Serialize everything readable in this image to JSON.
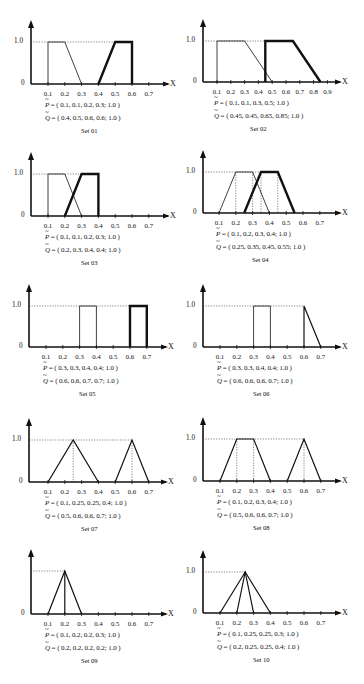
{
  "figure": {
    "y_tick_label_top": "1.0",
    "y_tick_label_zero": "0",
    "x_axis_label": "X",
    "p_symbol": "P",
    "q_symbol": "Q",
    "equals": " = ",
    "colors": {
      "ink": "#111111",
      "background": "#ffffff"
    }
  },
  "panels": [
    {
      "id": "set01",
      "label": "Set 01",
      "p_text": "( 0.1, 0.1, 0.2, 0.3; 1.0 )",
      "q_text": "( 0.4, 0.5, 0.6, 0.6; 1.0 )"
    },
    {
      "id": "set02",
      "label": "Set 02",
      "p_text": "( 0.1, 0.1, 0.3, 0.5; 1.0 )",
      "q_text": "( 0.45, 0.45, 0.65, 0.85; 1.0 )"
    },
    {
      "id": "set03",
      "label": "Set 03",
      "p_text": "( 0.1, 0.1, 0.2, 0.3; 1.0 )",
      "q_text": "( 0.2, 0.3, 0.4, 0.4; 1.0 )"
    },
    {
      "id": "set04",
      "label": "Set 04",
      "p_text": "( 0.1, 0.2, 0.3, 0.4; 1.0 )",
      "q_text": "( 0.25, 0.35, 0.45, 0.55; 1.0 )"
    },
    {
      "id": "set05",
      "label": "Set 05",
      "p_text": "( 0.3, 0.3, 0.4, 0.4; 1.0 )",
      "q_text": "( 0.6, 0.6, 0.7, 0.7; 1.0 )"
    },
    {
      "id": "set06",
      "label": "Set 06",
      "p_text": "( 0.3, 0.3, 0.4, 0.4; 1.0 )",
      "q_text": "( 0.6, 0.6, 0.6, 0.7; 1.0 )"
    },
    {
      "id": "set07",
      "label": "Set 07",
      "p_text": "( 0.1, 0.25, 0.25, 0.4; 1.0 )",
      "q_text": "( 0.5, 0.6, 0.6, 0.7; 1.0 )"
    },
    {
      "id": "set08",
      "label": "Set 08",
      "p_text": "( 0.1, 0.2, 0.3, 0.4; 1.0 )",
      "q_text": "( 0.5, 0.6, 0.6, 0.7; 1.0 )"
    },
    {
      "id": "set09",
      "label": "Set 09",
      "p_text": "( 0.1, 0.2, 0.2, 0.3; 1.0 )",
      "q_text": "( 0.2, 0.2, 0.2, 0.2; 1.0 )"
    },
    {
      "id": "set10",
      "label": "Set 10",
      "p_text": "( 0.1, 0.25, 0.25, 0.3; 1.0 )",
      "q_text": "( 0.2, 0.25, 0.25, 0.4; 1.0 )"
    }
  ],
  "chart_data": [
    {
      "type": "line",
      "title": "Set 01",
      "xlabel": "X",
      "ylabel": "",
      "x_ticks": [
        "0.1",
        "0.2",
        "0.3",
        "0.4",
        "0.5",
        "0.6",
        "0.7"
      ],
      "y_ticks": [
        "0",
        "1.0"
      ],
      "ylim": [
        0,
        1
      ],
      "grid": false,
      "series": [
        {
          "name": "P",
          "trapezoid": [
            0.1,
            0.1,
            0.2,
            0.3
          ],
          "height": 1.0,
          "style": "thin"
        },
        {
          "name": "Q",
          "trapezoid": [
            0.4,
            0.5,
            0.6,
            0.6
          ],
          "height": 1.0,
          "style": "bold"
        }
      ]
    },
    {
      "type": "line",
      "title": "Set 02",
      "xlabel": "X",
      "ylabel": "",
      "x_ticks": [
        "0.1",
        "0.2",
        "0.3",
        "0.4",
        "0.5",
        "0.6",
        "0.7",
        "0.8",
        "0.9"
      ],
      "y_ticks": [
        "0",
        "1.0"
      ],
      "ylim": [
        0,
        1
      ],
      "grid": false,
      "series": [
        {
          "name": "P",
          "trapezoid": [
            0.1,
            0.1,
            0.3,
            0.5
          ],
          "height": 1.0,
          "style": "thin"
        },
        {
          "name": "Q",
          "trapezoid": [
            0.45,
            0.45,
            0.65,
            0.85
          ],
          "height": 1.0,
          "style": "bold"
        }
      ]
    },
    {
      "type": "line",
      "title": "Set 03",
      "xlabel": "X",
      "ylabel": "",
      "x_ticks": [
        "0.1",
        "0.2",
        "0.3",
        "0.4",
        "0.5",
        "0.6",
        "0.7"
      ],
      "y_ticks": [
        "0",
        "1.0"
      ],
      "ylim": [
        0,
        1
      ],
      "grid": false,
      "series": [
        {
          "name": "P",
          "trapezoid": [
            0.1,
            0.1,
            0.2,
            0.3
          ],
          "height": 1.0,
          "style": "thin"
        },
        {
          "name": "Q",
          "trapezoid": [
            0.2,
            0.3,
            0.4,
            0.4
          ],
          "height": 1.0,
          "style": "bold"
        }
      ]
    },
    {
      "type": "line",
      "title": "Set 04",
      "xlabel": "X",
      "ylabel": "",
      "x_ticks": [
        "0.1",
        "0.2",
        "0.3",
        "0.4",
        "0.5",
        "0.6",
        "0.7"
      ],
      "y_ticks": [
        "0",
        "1.0"
      ],
      "ylim": [
        0,
        1
      ],
      "grid": false,
      "series": [
        {
          "name": "P",
          "trapezoid": [
            0.1,
            0.2,
            0.3,
            0.4
          ],
          "height": 1.0,
          "style": "thin"
        },
        {
          "name": "Q",
          "trapezoid": [
            0.25,
            0.35,
            0.45,
            0.55
          ],
          "height": 1.0,
          "style": "bold"
        }
      ]
    },
    {
      "type": "line",
      "title": "Set 05",
      "xlabel": "X",
      "ylabel": "",
      "x_ticks": [
        "0.1",
        "0.2",
        "0.3",
        "0.4",
        "0.5",
        "0.6",
        "0.7"
      ],
      "y_ticks": [
        "0",
        "1.0"
      ],
      "ylim": [
        0,
        1
      ],
      "grid": false,
      "series": [
        {
          "name": "P",
          "trapezoid": [
            0.3,
            0.3,
            0.4,
            0.4
          ],
          "height": 1.0,
          "style": "thin"
        },
        {
          "name": "Q",
          "trapezoid": [
            0.6,
            0.6,
            0.7,
            0.7
          ],
          "height": 1.0,
          "style": "bold"
        }
      ]
    },
    {
      "type": "line",
      "title": "Set 06",
      "xlabel": "X",
      "ylabel": "",
      "x_ticks": [
        "0.1",
        "0.2",
        "0.3",
        "0.4",
        "0.5",
        "0.6",
        "0.7"
      ],
      "y_ticks": [
        "0",
        "1.0"
      ],
      "ylim": [
        0,
        1
      ],
      "grid": false,
      "series": [
        {
          "name": "P",
          "trapezoid": [
            0.3,
            0.3,
            0.4,
            0.4
          ],
          "height": 1.0,
          "style": "thin"
        },
        {
          "name": "Q",
          "trapezoid": [
            0.6,
            0.6,
            0.6,
            0.7
          ],
          "height": 1.0,
          "style": "medium"
        }
      ]
    },
    {
      "type": "line",
      "title": "Set 07",
      "xlabel": "X",
      "ylabel": "",
      "x_ticks": [
        "0.1",
        "0.2",
        "0.3",
        "0.4",
        "0.5",
        "0.6",
        "0.7"
      ],
      "y_ticks": [
        "0",
        "1.0"
      ],
      "ylim": [
        0,
        1
      ],
      "grid": false,
      "series": [
        {
          "name": "P",
          "trapezoid": [
            0.1,
            0.25,
            0.25,
            0.4
          ],
          "height": 1.0,
          "style": "medium"
        },
        {
          "name": "Q",
          "trapezoid": [
            0.5,
            0.6,
            0.6,
            0.7
          ],
          "height": 1.0,
          "style": "medium"
        }
      ]
    },
    {
      "type": "line",
      "title": "Set 08",
      "xlabel": "X",
      "ylabel": "",
      "x_ticks": [
        "0.1",
        "0.2",
        "0.3",
        "0.4",
        "0.5",
        "0.6",
        "0.7"
      ],
      "y_ticks": [
        "0",
        "1.0"
      ],
      "ylim": [
        0,
        1
      ],
      "grid": false,
      "series": [
        {
          "name": "P",
          "trapezoid": [
            0.1,
            0.2,
            0.3,
            0.4
          ],
          "height": 1.0,
          "style": "medium"
        },
        {
          "name": "Q",
          "trapezoid": [
            0.5,
            0.6,
            0.6,
            0.7
          ],
          "height": 1.0,
          "style": "medium"
        }
      ]
    },
    {
      "type": "line",
      "title": "Set 09",
      "xlabel": "X",
      "ylabel": "",
      "x_ticks": [
        "0.1",
        "0.2",
        "0.3",
        "0.4",
        "0.5",
        "0.6",
        "0.7"
      ],
      "y_ticks": [
        "0"
      ],
      "ylim": [
        0,
        1
      ],
      "grid": false,
      "series": [
        {
          "name": "P",
          "trapezoid": [
            0.1,
            0.2,
            0.2,
            0.3
          ],
          "height": 1.0,
          "style": "medium"
        },
        {
          "name": "Q",
          "trapezoid": [
            0.2,
            0.2,
            0.2,
            0.2
          ],
          "height": 1.0,
          "style": "medium"
        }
      ]
    },
    {
      "type": "line",
      "title": "Set 10",
      "xlabel": "X",
      "ylabel": "",
      "x_ticks": [
        "0.1",
        "0.2",
        "0.3",
        "0.4",
        "0.5",
        "0.6",
        "0.7"
      ],
      "y_ticks": [
        "0",
        "1.0"
      ],
      "ylim": [
        0,
        1
      ],
      "grid": false,
      "series": [
        {
          "name": "P",
          "trapezoid": [
            0.1,
            0.25,
            0.25,
            0.3
          ],
          "height": 1.0,
          "style": "medium"
        },
        {
          "name": "Q",
          "trapezoid": [
            0.2,
            0.25,
            0.25,
            0.4
          ],
          "height": 1.0,
          "style": "medium"
        }
      ]
    }
  ]
}
